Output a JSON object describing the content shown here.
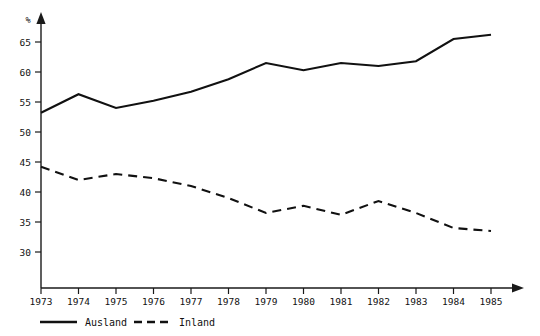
{
  "chart_data": {
    "type": "line",
    "title": "",
    "subtitle": "",
    "xlabel": "",
    "ylabel": "%",
    "y_unit_label": "%",
    "categories": [
      "1973",
      "1974",
      "1975",
      "1976",
      "1977",
      "1978",
      "1979",
      "1980",
      "1981",
      "1982",
      "1983",
      "1984",
      "1985"
    ],
    "x": [
      1973,
      1974,
      1975,
      1976,
      1977,
      1978,
      1979,
      1980,
      1981,
      1982,
      1983,
      1984,
      1985
    ],
    "xlim": [
      1973,
      1985
    ],
    "ylim": [
      27,
      68
    ],
    "yticks": [
      30,
      35,
      40,
      45,
      50,
      55,
      60,
      65
    ],
    "ytick_labels": [
      "30",
      "35",
      "40",
      "45",
      "50",
      "55",
      "60",
      "65"
    ],
    "xtick_labels": [
      "1973",
      "1974",
      "1975",
      "1976",
      "1977",
      "1978",
      "1979",
      "1980",
      "1981",
      "1982",
      "1983",
      "1984",
      "1985"
    ],
    "grid": false,
    "legend_position": "bottom-left",
    "series": [
      {
        "name": "Ausland",
        "style": "solid",
        "color": "#111111",
        "values": [
          53.2,
          56.3,
          54.0,
          55.2,
          56.7,
          58.8,
          61.5,
          60.3,
          61.5,
          61.0,
          61.8,
          65.5,
          66.2
        ]
      },
      {
        "name": "Inland",
        "style": "dashed",
        "color": "#111111",
        "values": [
          44.2,
          42.0,
          43.0,
          42.3,
          41.0,
          39.0,
          36.5,
          37.7,
          36.2,
          38.5,
          36.5,
          34.0,
          33.5
        ]
      }
    ],
    "legend": [
      {
        "label": "Ausland",
        "style": "solid"
      },
      {
        "label": "Inland",
        "style": "dashed"
      }
    ],
    "annotations": []
  },
  "axes": {
    "y_unit": "%",
    "y_tick_0": "30",
    "y_tick_1": "35",
    "y_tick_2": "40",
    "y_tick_3": "45",
    "y_tick_4": "50",
    "y_tick_5": "55",
    "y_tick_6": "60",
    "y_tick_7": "65"
  },
  "x_axis": {
    "t0": "1973",
    "t1": "1974",
    "t2": "1975",
    "t3": "1976",
    "t4": "1977",
    "t5": "1978",
    "t6": "1979",
    "t7": "1980",
    "t8": "1981",
    "t9": "1982",
    "t10": "1983",
    "t11": "1984",
    "t12": "1985"
  },
  "legend": {
    "series_1_label": "Ausland",
    "series_2_label": "Inland"
  },
  "colors": {
    "ink": "#111111",
    "background": "#ffffff"
  }
}
